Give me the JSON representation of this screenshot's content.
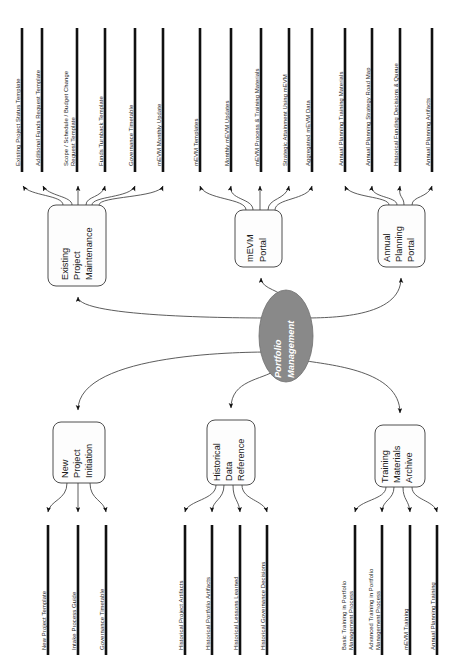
{
  "diagram": {
    "title": "Portfolio Management",
    "hub": {
      "label_line1": "Portfolio",
      "label_line2": "Management",
      "fill": "#898989",
      "text_color": "#ffffff"
    },
    "nodes": [
      {
        "id": "existing-project-maintenance",
        "label_lines": [
          "Existing",
          "Project",
          "Maintenance"
        ],
        "position": "top-left"
      },
      {
        "id": "mevm-portal",
        "label_lines": [
          "mEVM",
          "Portal"
        ],
        "position": "top-center"
      },
      {
        "id": "annual-planning-portal",
        "label_lines": [
          "Annual",
          "Planning",
          "Portal"
        ],
        "position": "top-right"
      },
      {
        "id": "new-project-initiation",
        "label_lines": [
          "New",
          "Project",
          "Initiation"
        ],
        "position": "bottom-left"
      },
      {
        "id": "historical-data-reference",
        "label_lines": [
          "Historical",
          "Data",
          "Reference"
        ],
        "position": "bottom-center"
      },
      {
        "id": "training-materials-archive",
        "label_lines": [
          "Training",
          "Materials",
          "Archive"
        ],
        "position": "bottom-right"
      }
    ],
    "outputs": {
      "existing-project-maintenance": [
        {
          "label_lines": [
            "Existing Project Status Template"
          ]
        },
        {
          "label_lines": [
            "Additional Funds Request Template"
          ]
        },
        {
          "label_lines": [
            "Scope / Schedule / Budget Change",
            "Request Template"
          ]
        },
        {
          "label_lines": [
            "Funds Turnback Template"
          ]
        },
        {
          "label_lines": [
            "Governance Timetable"
          ]
        },
        {
          "label_lines": [
            "mEVM Monthly Update"
          ]
        }
      ],
      "mevm-portal": [
        {
          "label_lines": [
            "mEVM Templates"
          ]
        },
        {
          "label_lines": [
            "Monthly mEVM Updates"
          ]
        },
        {
          "label_lines": [
            "mEVM Process & Training Materials"
          ]
        },
        {
          "label_lines": [
            "Strategic Attainment Using mEVM"
          ]
        },
        {
          "label_lines": [
            "Aggregated mEVM Data"
          ]
        }
      ],
      "annual-planning-portal": [
        {
          "label_lines": [
            "Annual Planning Training Materials"
          ]
        },
        {
          "label_lines": [
            "Annual Planning Strategy Road Map"
          ]
        },
        {
          "label_lines": [
            "Historical Funding Decisions & Queue"
          ]
        },
        {
          "label_lines": [
            "Annual Planning Artifacts"
          ]
        }
      ],
      "new-project-initiation": [
        {
          "label_lines": [
            "New Project Template"
          ]
        },
        {
          "label_lines": [
            "Intake Process Guide"
          ]
        },
        {
          "label_lines": [
            "Governance Timetable"
          ]
        }
      ],
      "historical-data-reference": [
        {
          "label_lines": [
            "Historical Project Artifacts"
          ]
        },
        {
          "label_lines": [
            "Historical Portfolio Artifacts"
          ]
        },
        {
          "label_lines": [
            "Historical Lessons Learned"
          ]
        },
        {
          "label_lines": [
            "Historical Governance Decisions"
          ]
        }
      ],
      "training-materials-archive": [
        {
          "label_lines": [
            "Basic Training in Portfolio",
            "Management Process"
          ]
        },
        {
          "label_lines": [
            "Advanced Training in Portfolio",
            "Management Process"
          ]
        },
        {
          "label_lines": [
            "mEVM Training"
          ]
        },
        {
          "label_lines": [
            "Annual Planning Training"
          ]
        }
      ]
    }
  }
}
